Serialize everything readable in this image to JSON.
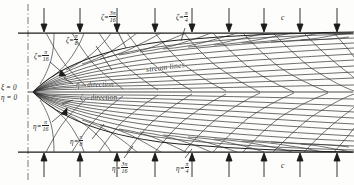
{
  "figure": {
    "origin_labels": {
      "xi_zero": "ξ = 0",
      "eta_zero": "η = 0"
    },
    "direction_labels": {
      "eta_direction": "η – direction",
      "zeta_direction": "ζ – direction"
    },
    "stream_label": "stream lines",
    "velocity_label_top": "c",
    "velocity_label_bottom": "c",
    "zeta_labels": [
      {
        "sym": "ζ",
        "eq": "=",
        "num": "π",
        "den": "16",
        "name": "zeta-pi-16"
      },
      {
        "sym": "ζ",
        "eq": "=",
        "num": "π",
        "den": "8",
        "name": "zeta-pi-8"
      },
      {
        "sym": "ζ",
        "eq": "=",
        "num": "3π",
        "den": "16",
        "name": "zeta-3pi-16"
      },
      {
        "sym": "ζ",
        "eq": "=",
        "num": "π",
        "den": "4",
        "name": "zeta-pi-4"
      }
    ],
    "eta_labels": [
      {
        "sym": "η",
        "eq": "=",
        "num": "π",
        "den": "16",
        "name": "eta-pi-16"
      },
      {
        "sym": "η",
        "eq": "=",
        "num": "π",
        "den": "8",
        "name": "eta-pi-8"
      },
      {
        "sym": "η",
        "eq": "=",
        "num": "3π",
        "den": "16",
        "name": "eta-3pi-16"
      },
      {
        "sym": "η",
        "eq": "=",
        "num": "π",
        "den": "4",
        "name": "eta-pi-4"
      }
    ],
    "colors": {
      "ink": "#1c1c1c",
      "grid": "#3a3a3a",
      "paper": "#fdfdfc",
      "axis": "#4a4a4a"
    },
    "geometry": {
      "top_wall_y": 33,
      "bottom_wall_y": 152,
      "centerline_y": 92,
      "axis_x": 28,
      "nose_x": 33,
      "right_edge_x": 352,
      "top_arrow_count": 9,
      "bottom_arrow_count": 9
    }
  }
}
